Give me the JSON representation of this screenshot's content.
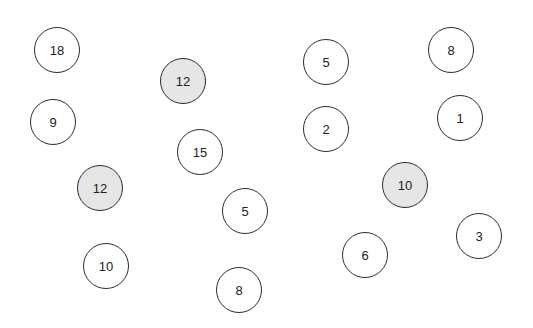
{
  "diagram": {
    "colors": {
      "background": "#ffffff",
      "stroke": "#2b2b2b",
      "shaded_fill": "#e6e6e6",
      "unshaded_fill": "#ffffff",
      "text": "#222222"
    },
    "nodes": [
      {
        "label": "18",
        "x": 57,
        "y": 50,
        "shaded": false
      },
      {
        "label": "12",
        "x": 183,
        "y": 81,
        "shaded": true
      },
      {
        "label": "5",
        "x": 326,
        "y": 62,
        "shaded": false
      },
      {
        "label": "8",
        "x": 451,
        "y": 50,
        "shaded": false
      },
      {
        "label": "9",
        "x": 53,
        "y": 122,
        "shaded": false
      },
      {
        "label": "15",
        "x": 200,
        "y": 152,
        "shaded": false
      },
      {
        "label": "2",
        "x": 326,
        "y": 129,
        "shaded": false
      },
      {
        "label": "1",
        "x": 460,
        "y": 118,
        "shaded": false
      },
      {
        "label": "12",
        "x": 100,
        "y": 188,
        "shaded": true
      },
      {
        "label": "10",
        "x": 405,
        "y": 185,
        "shaded": true
      },
      {
        "label": "5",
        "x": 245,
        "y": 211,
        "shaded": false
      },
      {
        "label": "3",
        "x": 479,
        "y": 236,
        "shaded": false
      },
      {
        "label": "6",
        "x": 365,
        "y": 255,
        "shaded": false
      },
      {
        "label": "10",
        "x": 106,
        "y": 266,
        "shaded": false
      },
      {
        "label": "8",
        "x": 239,
        "y": 290,
        "shaded": false
      }
    ]
  }
}
